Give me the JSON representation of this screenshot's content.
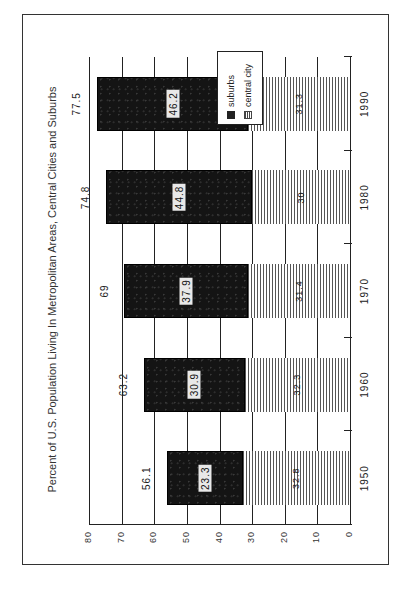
{
  "chart_data": {
    "type": "bar",
    "stacked": true,
    "orientation": "vertical (page rotated 90° counter-clockwise)",
    "title": "Percent of U.S. Population Living In Metropolitan Areas, Central Cities and Suburbs",
    "xlabel": "",
    "ylabel": "",
    "ylim": [
      0,
      80
    ],
    "yticks": [
      "0",
      "10",
      "20",
      "30",
      "40",
      "50",
      "60",
      "70",
      "80"
    ],
    "grid": true,
    "legend_position": "upper right (top-right of rotated page)",
    "categories": [
      "1950",
      "1960",
      "1970",
      "1980",
      "1990"
    ],
    "series": [
      {
        "name": "central city",
        "pattern": "hatched",
        "values": [
          32.8,
          32.3,
          31.4,
          30,
          31.3
        ]
      },
      {
        "name": "suburbs",
        "pattern": "solid-dark",
        "values": [
          23.3,
          30.9,
          37.9,
          44.8,
          46.2
        ]
      }
    ],
    "totals": [
      56.1,
      63.2,
      69,
      74.8,
      77.5
    ],
    "total_labels": [
      "56.1",
      "63.2",
      "69",
      "74.8",
      "77.5"
    ],
    "central_city_labels": [
      "32.8",
      "32.3",
      "31.4",
      "30",
      "31.3"
    ],
    "suburbs_labels": [
      "23.3",
      "30.9",
      "37.9",
      "44.8",
      "46.2"
    ]
  },
  "legend": {
    "items": [
      {
        "label": "suburbs"
      },
      {
        "label": "central city"
      }
    ]
  }
}
